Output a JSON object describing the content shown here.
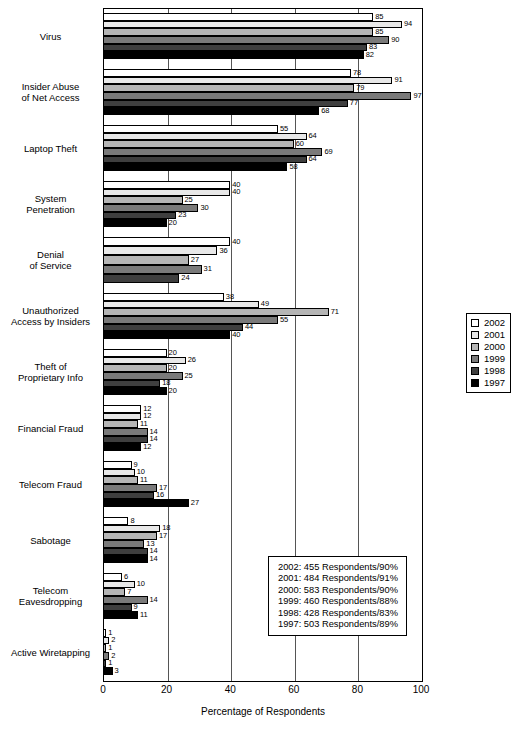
{
  "chart_data": {
    "type": "bar",
    "orientation": "horizontal",
    "title": "",
    "xlabel": "Percentage of Respondents",
    "ylabel": "",
    "xlim": [
      0,
      100
    ],
    "xticks": [
      0,
      20,
      40,
      60,
      80,
      100
    ],
    "grid": true,
    "legend_position": "right",
    "categories": [
      "Virus",
      "Insider Abuse\nof Net Access",
      "Laptop Theft",
      "System\nPenetration",
      "Denial\nof Service",
      "Unauthorized\nAccess by Insiders",
      "Theft of\nProprietary Info",
      "Financial Fraud",
      "Telecom Fraud",
      "Sabotage",
      "Telecom\nEavesdropping",
      "Active Wiretapping"
    ],
    "series": [
      {
        "name": "2002",
        "color": "#ffffff",
        "values": [
          85,
          78,
          55,
          40,
          40,
          38,
          20,
          12,
          9,
          8,
          6,
          1
        ]
      },
      {
        "name": "2001",
        "color": "#e8e8e8",
        "values": [
          94,
          91,
          64,
          40,
          36,
          49,
          26,
          12,
          10,
          18,
          10,
          2
        ]
      },
      {
        "name": "2000",
        "color": "#b5b5b5",
        "values": [
          85,
          79,
          60,
          25,
          27,
          71,
          20,
          11,
          11,
          17,
          7,
          1
        ]
      },
      {
        "name": "1999",
        "color": "#7a7a7a",
        "values": [
          90,
          97,
          69,
          30,
          31,
          55,
          25,
          14,
          17,
          13,
          14,
          2
        ]
      },
      {
        "name": "1998",
        "color": "#3f3f3f",
        "values": [
          83,
          77,
          64,
          23,
          24,
          44,
          18,
          14,
          16,
          14,
          9,
          1
        ]
      },
      {
        "name": "1997",
        "color": "#000000",
        "values": [
          82,
          68,
          58,
          20,
          null,
          40,
          20,
          12,
          27,
          14,
          11,
          3
        ]
      }
    ]
  },
  "legend": {
    "items": [
      {
        "label": "2002",
        "color": "#ffffff"
      },
      {
        "label": "2001",
        "color": "#e8e8e8"
      },
      {
        "label": "2000",
        "color": "#b5b5b5"
      },
      {
        "label": "1999",
        "color": "#7a7a7a"
      },
      {
        "label": "1998",
        "color": "#3f3f3f"
      },
      {
        "label": "1997",
        "color": "#000000"
      }
    ]
  },
  "note_box": {
    "lines": [
      "2002: 455 Respondents/90%",
      "2001: 484 Respondents/91%",
      "2000: 583 Respondents/90%",
      "1999: 460 Respondents/88%",
      "1998: 428 Respondents/83%",
      "1997: 503 Respondents/89%"
    ]
  },
  "axis": {
    "x_title": "Percentage of Respondents",
    "x_tick_labels": [
      "0",
      "20",
      "40",
      "60",
      "80",
      "100"
    ]
  }
}
